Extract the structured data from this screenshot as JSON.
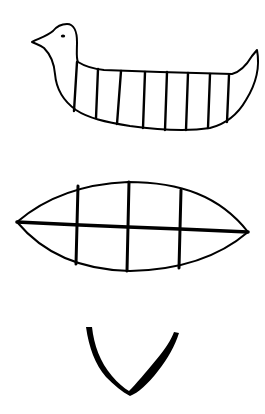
{
  "figure": {
    "background": "#ffffff",
    "ink": "#000000",
    "symbols": [
      {
        "id": "bird-boat",
        "label": "Bird-shaped boat with vertical ribs",
        "rib_count": 8
      },
      {
        "id": "lens-grid",
        "label": "Lens-shaped figure divided by one horizontal and three vertical lines",
        "vertical_lines": 3,
        "horizontal_lines": 1
      },
      {
        "id": "v-shape",
        "label": "Curved V shape"
      }
    ]
  }
}
